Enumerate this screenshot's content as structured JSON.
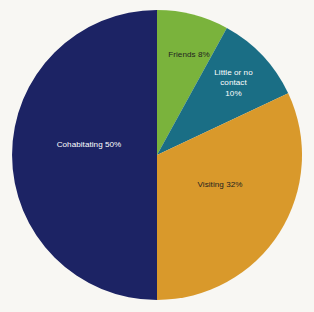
{
  "chart_data": {
    "type": "pie",
    "title": "",
    "subtitle": "",
    "xlabel": "",
    "ylabel": "",
    "legend_position": "none",
    "grid": false,
    "labels_inside_slices": true,
    "start_angle_deg": 0,
    "direction": "clockwise",
    "categories": [
      "Friends",
      "Little or no contact",
      "Visiting",
      "Cohabitating"
    ],
    "values": [
      8,
      10,
      32,
      50
    ],
    "unit": "%",
    "colors": [
      "#7ab33c",
      "#1a6e85",
      "#d9992b",
      "#1c2364"
    ],
    "slices": [
      {
        "name": "Friends",
        "value": 8,
        "value_text": "8%",
        "label": "Friends 8%",
        "color": "#7ab33c",
        "text_color": "#231f20",
        "start_deg": 0,
        "end_deg": 28.8
      },
      {
        "name": "Little or no contact",
        "value": 10,
        "value_text": "10%",
        "label": "Little or no\ncontact\n10%",
        "color": "#1a6e85",
        "text_color": "#ffffff",
        "start_deg": 28.8,
        "end_deg": 64.8
      },
      {
        "name": "Visiting",
        "value": 32,
        "value_text": "32%",
        "label": "Visiting 32%",
        "color": "#d9992b",
        "text_color": "#231f20",
        "start_deg": 64.8,
        "end_deg": 180
      },
      {
        "name": "Cohabitating",
        "value": 50,
        "value_text": "50%",
        "label": "Cohabitating 50%",
        "color": "#1c2364",
        "text_color": "#ffffff",
        "start_deg": 180,
        "end_deg": 360
      }
    ],
    "background_color": "#f8f7f3",
    "total": 100
  },
  "geometry": {
    "center_x": 157,
    "center_y": 155,
    "radius": 145
  }
}
